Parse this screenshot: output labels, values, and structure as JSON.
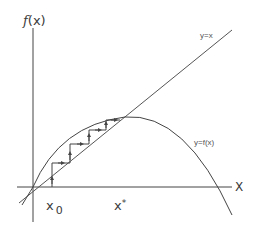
{
  "diagram": {
    "labels": {
      "y_axis": "f(x)",
      "y_axis_func": "f",
      "y_axis_arg": "(x)",
      "x_axis": "X",
      "identity_line": "y=x",
      "curve": "y=f(x)",
      "start_point": "x",
      "start_point_sub": "0",
      "fixed_point": "x",
      "fixed_point_sup": "*"
    },
    "elements": {
      "axes": [
        "horizontal x-axis",
        "vertical f(x)-axis"
      ],
      "identity_line": "straight line through origin with slope 1",
      "curve": "concave-down parabola through origin, peaking near fixed point, crossing x-axis to the right",
      "cobweb_steps": 4,
      "arrows": "vertical arrows pointing up to curve, horizontal arrows pointing right to line"
    },
    "colors": {
      "stroke": "#444444",
      "background": "#ffffff"
    }
  }
}
